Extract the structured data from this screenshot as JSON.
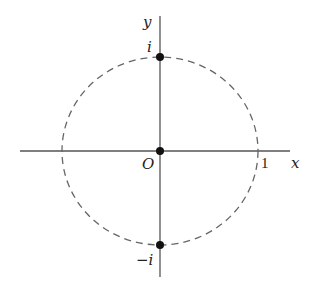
{
  "diagram": {
    "type": "complex-plane-unit-circle",
    "axes": {
      "x_label": "x",
      "y_label": "y",
      "origin_label": "O",
      "tick_label_x": "1"
    },
    "circle": {
      "style": "dashed",
      "represents": "unit circle"
    },
    "points": [
      {
        "label": "i",
        "position": "top"
      },
      {
        "label": "O",
        "position": "origin"
      },
      {
        "label": "−i",
        "position": "bottom"
      }
    ],
    "colors": {
      "stroke": "#555555",
      "point": "#111111",
      "text": "#222222"
    }
  }
}
